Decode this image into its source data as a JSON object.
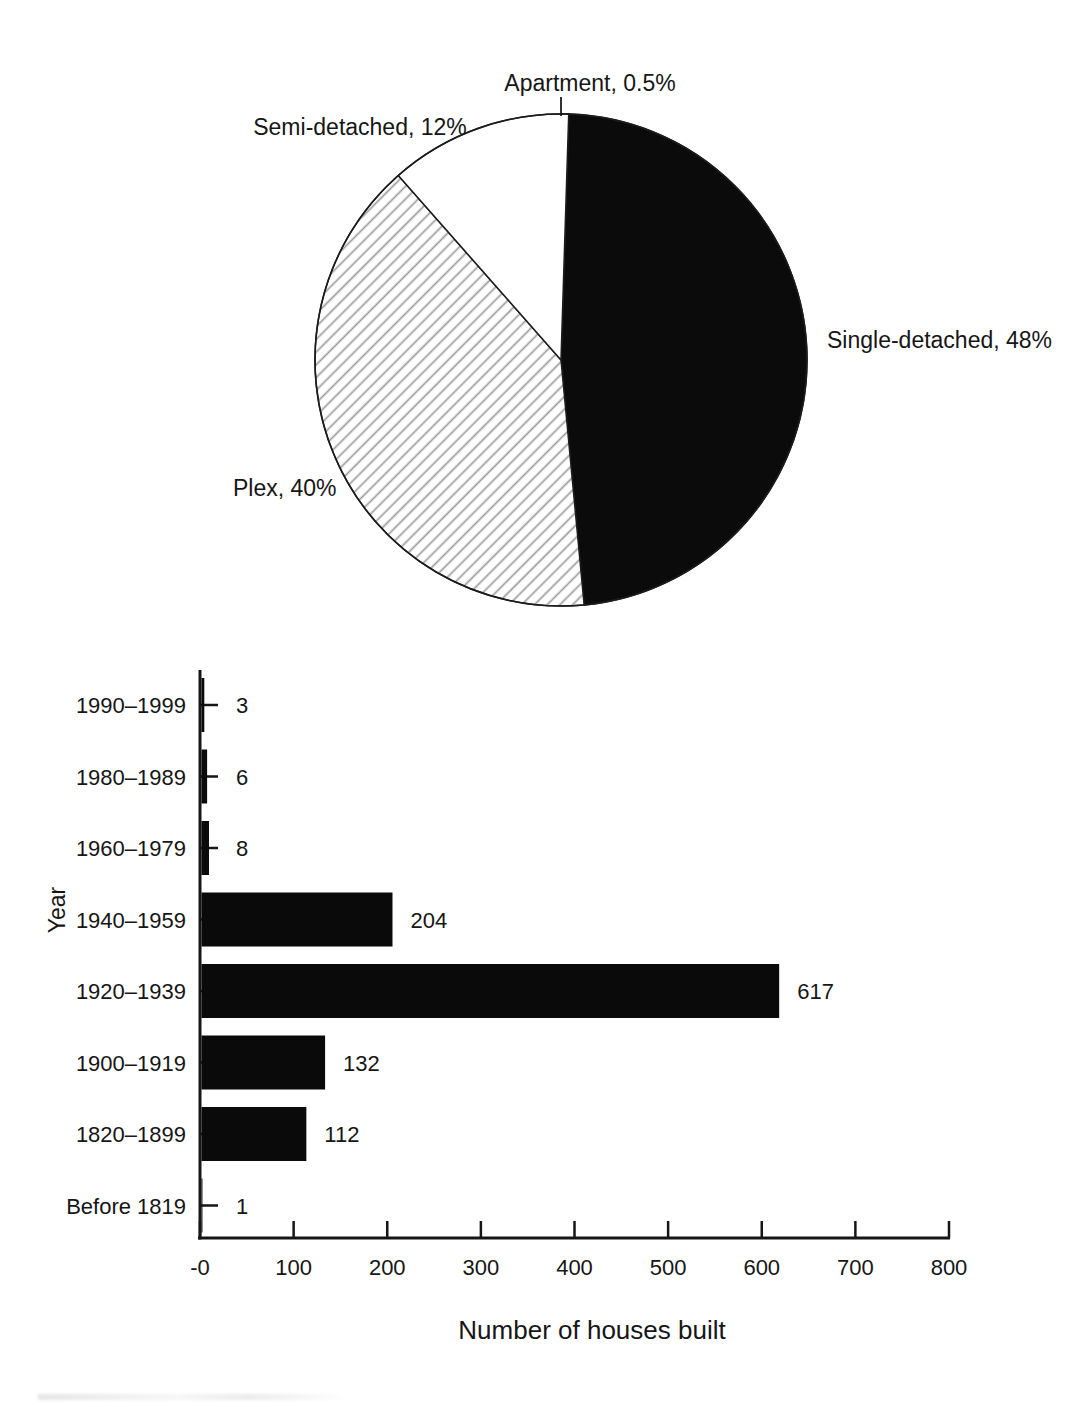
{
  "figure": {
    "description_visible_text_only": true
  },
  "chart_data": [
    {
      "type": "pie",
      "title": "",
      "legend": "none",
      "label_style": "outside-callout",
      "start_angle_deg": 0,
      "direction": "clockwise",
      "slices": [
        {
          "label": "Apartment",
          "value_pct": 0.5,
          "display": "Apartment, 0.5%",
          "fill": "dark-gray"
        },
        {
          "label": "Single-detached",
          "value_pct": 48,
          "display": "Single-detached, 48%",
          "fill": "black"
        },
        {
          "label": "Plex",
          "value_pct": 40,
          "display": "Plex, 40%",
          "fill": "diagonal-hatch"
        },
        {
          "label": "Semi-detached",
          "value_pct": 12,
          "display": "Semi-detached, 12%",
          "fill": "white"
        }
      ],
      "colors": {
        "black": "#0b0b0b",
        "dark_gray": "#4a4a4a",
        "white": "#ffffff",
        "hatch_line": "#9b9b9b",
        "outline": "#1c1c1c"
      }
    },
    {
      "type": "bar",
      "orientation": "horizontal",
      "categories": [
        "1990–1999",
        "1980–1989",
        "1960–1979",
        "1940–1959",
        "1920–1939",
        "1900–1919",
        "1820–1899",
        "Before 1819"
      ],
      "values": [
        3,
        6,
        8,
        204,
        617,
        132,
        112,
        1
      ],
      "value_labels": [
        "3",
        "6",
        "8",
        "204",
        "617",
        "132",
        "112",
        "1"
      ],
      "xlabel": "Number of houses built",
      "ylabel": "Year",
      "xlim": [
        0,
        800
      ],
      "x_ticks": [
        "-0",
        "100",
        "200",
        "300",
        "400",
        "500",
        "600",
        "700",
        "800"
      ],
      "grid": "off",
      "legend": "none",
      "bar_color": "#0a0a0a",
      "axis_color": "#161616",
      "value_labels_shown": true
    }
  ]
}
